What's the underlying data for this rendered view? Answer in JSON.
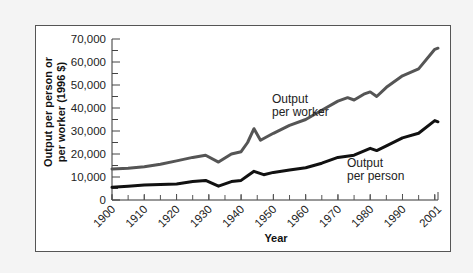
{
  "chart_data": {
    "type": "line",
    "title": "",
    "xlabel": "Year",
    "ylabel": "Output per person or per worker (1996 $)",
    "xlim": [
      1900,
      2001
    ],
    "ylim": [
      0,
      70000
    ],
    "x_ticks": [
      "1900",
      "1910",
      "1920",
      "1930",
      "1940",
      "1950",
      "1960",
      "1970",
      "1980",
      "1990",
      "2001"
    ],
    "y_ticks": [
      "0",
      "10,000",
      "20,000",
      "30,000",
      "40,000",
      "50,000",
      "60,000",
      "70,000"
    ],
    "grid": false,
    "legend": "inline annotations",
    "series": [
      {
        "name": "Output per worker",
        "color": "#555555",
        "x": [
          1900,
          1905,
          1910,
          1915,
          1920,
          1925,
          1929,
          1933,
          1937,
          1940,
          1942,
          1944,
          1946,
          1948,
          1950,
          1955,
          1960,
          1965,
          1970,
          1973,
          1975,
          1978,
          1980,
          1982,
          1985,
          1990,
          1995,
          2000,
          2001
        ],
        "values": [
          13500,
          13800,
          14500,
          15500,
          17000,
          18500,
          19500,
          16500,
          20000,
          21000,
          25000,
          31000,
          26000,
          27500,
          29000,
          32500,
          35000,
          39000,
          43000,
          44500,
          43500,
          46000,
          47000,
          45000,
          49000,
          54000,
          57000,
          65500,
          66000
        ]
      },
      {
        "name": "Output per person",
        "color": "#111111",
        "x": [
          1900,
          1905,
          1910,
          1915,
          1920,
          1925,
          1929,
          1933,
          1937,
          1940,
          1942,
          1944,
          1947,
          1950,
          1955,
          1960,
          1965,
          1970,
          1975,
          1980,
          1982,
          1985,
          1990,
          1995,
          2000,
          2001
        ],
        "values": [
          5500,
          6000,
          6500,
          6700,
          7000,
          8000,
          8500,
          6000,
          8000,
          8500,
          10500,
          12500,
          11000,
          12000,
          13000,
          14000,
          16000,
          18500,
          19500,
          22500,
          21500,
          23500,
          27000,
          29000,
          34500,
          34000
        ]
      }
    ],
    "annotations": [
      {
        "text": [
          "Output",
          "per worker"
        ],
        "series": "Output per worker"
      },
      {
        "text": [
          "Output",
          "per person"
        ],
        "series": "Output per person"
      }
    ]
  },
  "labels": {
    "ylabel_line1": "Output per person or",
    "ylabel_line2": "per worker (1996 $)",
    "xlabel": "Year",
    "annot_worker_1": "Output",
    "annot_worker_2": "per worker",
    "annot_person_1": "Output",
    "annot_person_2": "per person"
  }
}
